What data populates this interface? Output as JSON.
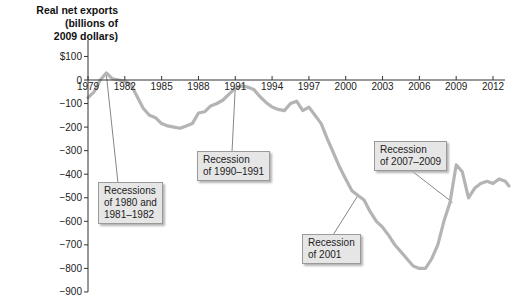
{
  "chart_data": {
    "type": "line",
    "title": "",
    "ylabel": "Real net exports (billions of 2009 dollars)",
    "xlabel": "",
    "ylim": [
      -900,
      100
    ],
    "xlim": [
      1979,
      2013.3
    ],
    "grid": false,
    "line_color": "#b4b4b4",
    "y_ticks": [
      100,
      0,
      -100,
      -200,
      -300,
      -400,
      -500,
      -600,
      -700,
      -800,
      -900
    ],
    "y_tick_labels": [
      "$100",
      "0",
      "−100",
      "−200",
      "−300",
      "−400",
      "−500",
      "−600",
      "−700",
      "−800",
      "−900"
    ],
    "x_ticks": [
      1979,
      1982,
      1985,
      1988,
      1991,
      1994,
      1997,
      2000,
      2003,
      2006,
      2009,
      2012
    ],
    "x_tick_labels": [
      "1979",
      "1982",
      "1985",
      "1988",
      "1991",
      "1994",
      "1997",
      "2000",
      "2003",
      "2006",
      "2009",
      "2012"
    ],
    "series": [
      {
        "name": "Real net exports",
        "x": [
          1979,
          1979.5,
          1980,
          1980.5,
          1981,
          1981.5,
          1982,
          1982.5,
          1983,
          1983.5,
          1984,
          1984.5,
          1985,
          1985.5,
          1986,
          1986.5,
          1987,
          1987.5,
          1988,
          1988.5,
          1989,
          1989.5,
          1990,
          1990.5,
          1991,
          1991.5,
          1992,
          1992.5,
          1993,
          1993.5,
          1994,
          1994.5,
          1995,
          1995.5,
          1996,
          1996.5,
          1997,
          1997.5,
          1998,
          1998.5,
          1999,
          1999.5,
          2000,
          2000.5,
          2001,
          2001.5,
          2002,
          2002.5,
          2003,
          2003.5,
          2004,
          2004.5,
          2005,
          2005.5,
          2006,
          2006.5,
          2007,
          2007.5,
          2008,
          2008.5,
          2009,
          2009.5,
          2010,
          2010.5,
          2011,
          2011.5,
          2012,
          2012.5,
          2013,
          2013.3
        ],
        "values": [
          -75,
          -50,
          0,
          30,
          5,
          0,
          -5,
          -20,
          -70,
          -120,
          -150,
          -160,
          -185,
          -195,
          -200,
          -205,
          -195,
          -185,
          -140,
          -135,
          -110,
          -100,
          -85,
          -60,
          -35,
          -25,
          -30,
          -40,
          -70,
          -95,
          -115,
          -125,
          -130,
          -100,
          -90,
          -130,
          -115,
          -150,
          -185,
          -250,
          -310,
          -370,
          -420,
          -470,
          -490,
          -510,
          -560,
          -600,
          -625,
          -660,
          -700,
          -730,
          -760,
          -790,
          -800,
          -800,
          -760,
          -700,
          -600,
          -520,
          -360,
          -390,
          -500,
          -460,
          -440,
          -430,
          -440,
          -420,
          -430,
          -450
        ]
      }
    ],
    "annotations": [
      {
        "text": "Recessions of 1980 and 1981–1982",
        "target_year": 1980.5
      },
      {
        "text": "Recession of 1990–1991",
        "target_year": 1991
      },
      {
        "text": "Recession of 2001",
        "target_year": 2001
      },
      {
        "text": "Recession of 2007–2009",
        "target_year": 2008.5
      }
    ]
  },
  "labels": {
    "ylabel_line1": "Real net exports",
    "ylabel_line2": "(billions of",
    "ylabel_line3": "2009 dollars)",
    "callout1_line1": "Recessions",
    "callout1_line2": "of 1980 and",
    "callout1_line3": "1981–1982",
    "callout2_line1": "Recession",
    "callout2_line2": "of 1990–1991",
    "callout3_line1": "Recession",
    "callout3_line2": "of 2001",
    "callout4_line1": "Recession",
    "callout4_line2": "of 2007–2009"
  }
}
